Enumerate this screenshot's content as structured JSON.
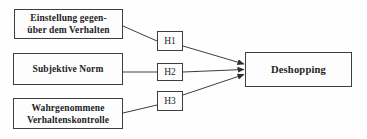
{
  "diagram": {
    "colors": {
      "background": "#fefefe",
      "line": "#3e3e3e",
      "text": "#1f1f1f"
    },
    "nodes": {
      "einstellung": {
        "line1": "Einstellung gegen-",
        "line2": "über dem Verhalten"
      },
      "subjektive_norm": {
        "label": "Subjektive Norm"
      },
      "verhaltenskontrolle": {
        "line1": "Wahrgenommene",
        "line2": "Verhaltenskontrolle"
      },
      "h1": {
        "label": "H1"
      },
      "h2": {
        "label": "H2"
      },
      "h3": {
        "label": "H3"
      },
      "deshopping": {
        "label": "Deshopping"
      }
    },
    "edges": [
      {
        "from": "einstellung",
        "to": "h1",
        "arrow": false
      },
      {
        "from": "h1",
        "to": "deshopping",
        "arrow": true
      },
      {
        "from": "subjektive_norm",
        "to": "h2",
        "arrow": false
      },
      {
        "from": "h2",
        "to": "deshopping",
        "arrow": true
      },
      {
        "from": "verhaltenskontrolle",
        "to": "h3",
        "arrow": false
      },
      {
        "from": "h3",
        "to": "deshopping",
        "arrow": true
      }
    ]
  }
}
